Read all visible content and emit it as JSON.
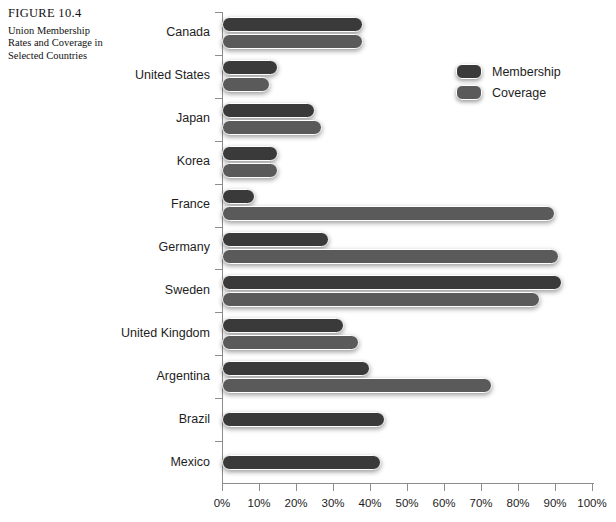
{
  "figure": {
    "number": "FIGURE 10.4",
    "title": "Union Membership Rates and Coverage in Selected Countries"
  },
  "legend": {
    "items": [
      {
        "label": "Membership",
        "color": "#3a3a3a",
        "key": "membership"
      },
      {
        "label": "Coverage",
        "color": "#5a5a5a",
        "key": "coverage"
      }
    ]
  },
  "source_note": "",
  "chart_data": {
    "type": "bar",
    "orientation": "horizontal",
    "title": "Union Membership Rates and Coverage in Selected Countries",
    "xlabel": "",
    "ylabel": "",
    "xlim": [
      0,
      100
    ],
    "xticks": [
      0,
      10,
      20,
      30,
      40,
      50,
      60,
      70,
      80,
      90,
      100
    ],
    "xticklabels": [
      "0%",
      "10%",
      "20%",
      "30%",
      "40%",
      "50%",
      "60%",
      "70%",
      "80%",
      "90%",
      "100%"
    ],
    "grid": false,
    "legend_position": "upper right",
    "categories": [
      "Canada",
      "United States",
      "Japan",
      "Korea",
      "France",
      "Germany",
      "Sweden",
      "United Kingdom",
      "Argentina",
      "Brazil",
      "Mexico"
    ],
    "series": [
      {
        "name": "Membership",
        "color": "#3a3a3a",
        "values": [
          38,
          15,
          25,
          15,
          9,
          29,
          92,
          33,
          40,
          44,
          43
        ]
      },
      {
        "name": "Coverage",
        "color": "#5a5a5a",
        "values": [
          38,
          13,
          27,
          15,
          90,
          91,
          86,
          37,
          73,
          null,
          null
        ]
      }
    ],
    "units": "percent"
  }
}
